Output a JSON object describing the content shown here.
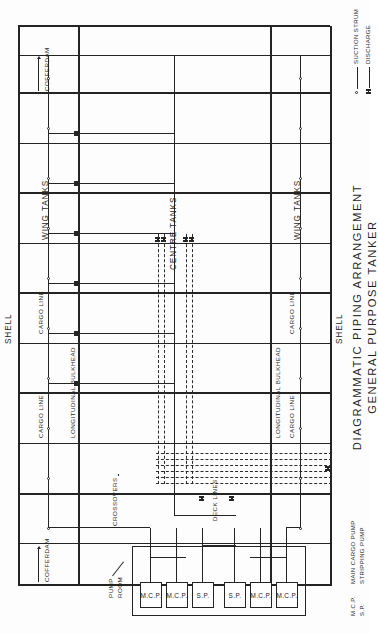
{
  "drawing": {
    "title_line1": "DIAGRAMMATIC PIPING ARRANGEMENT",
    "title_line2": "GENERAL PURPOSE TANKER"
  },
  "labels": {
    "shell_fwd": "SHELL",
    "shell_aft": "SHELL",
    "cofferdam_fwd": "COFFERDAM",
    "cofferdam_aft": "COFFERDAM",
    "wing_tanks_upper": "WING TANKS",
    "wing_tanks_lower": "WING TANKS",
    "centre_tanks": "CENTRE TANKS",
    "cargo_line_upper": "CARGO LINE",
    "cargo_line_lower": "CARGO LINE",
    "cargo_line_upper_b": "CARGO LINE",
    "cargo_line_lower_b": "CARGO LINE",
    "long_bulkhead_upper": "LONGITUDINAL BULKHEAD",
    "long_bulkhead_lower": "LONGITUDINAL BULKHEAD",
    "crossovers": "CROSSOVERS",
    "deck_lines": "DECK LINES",
    "pump_room": "PUMP ROOM"
  },
  "pumps": [
    {
      "id": "mcp-1",
      "label": "M.C.P."
    },
    {
      "id": "mcp-2",
      "label": "M.C.P."
    },
    {
      "id": "sp-1",
      "label": "S.P."
    },
    {
      "id": "sp-2",
      "label": "S.P."
    },
    {
      "id": "mcp-3",
      "label": "M.C.P."
    },
    {
      "id": "mcp-4",
      "label": "M.C.P."
    }
  ],
  "legend_symbols": [
    {
      "id": "suction-strum",
      "label": "SUCTION STRUM",
      "symbol": "circle-on-line"
    },
    {
      "id": "discharge",
      "label": "DISCHARGE",
      "symbol": "double-bar-on-line"
    }
  ],
  "legend_abbrev": [
    {
      "abbr": "M.C.P.",
      "meaning": "MAIN CARGO PUMP"
    },
    {
      "abbr": "S.P.",
      "meaning": "STRIPPING PUMP"
    }
  ],
  "colors": {
    "ink": "#242424",
    "paper": "#fdfdfd"
  }
}
